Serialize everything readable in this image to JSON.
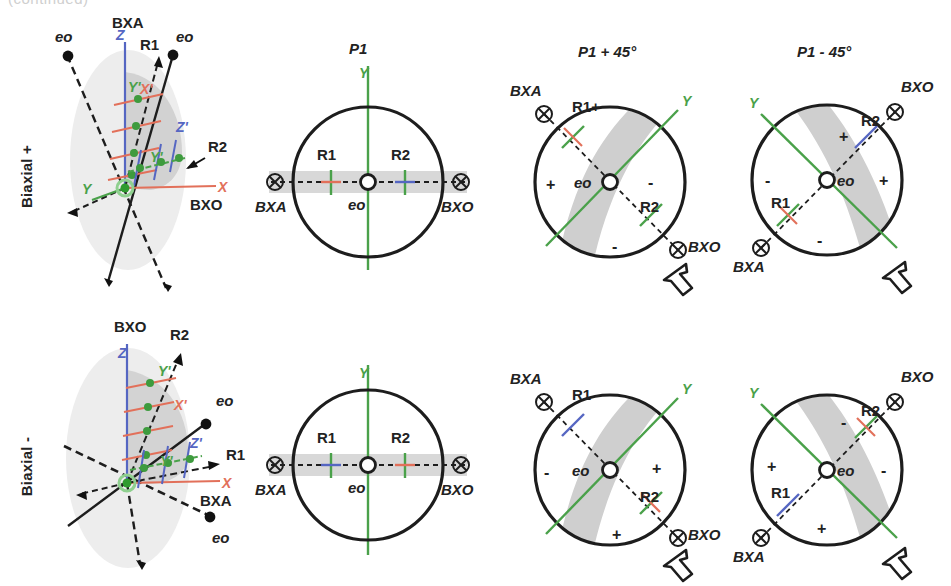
{
  "figure": {
    "clipped_top_text": "(continued)",
    "background": "#ffffff",
    "colors": {
      "axis_x": "#e2705a",
      "axis_y": "#4aa14a",
      "axis_z": "#5566c2",
      "outline": "#1d1d1d",
      "band_shade": "#cfcfcf",
      "blob_shade": "#e6e6e6",
      "blob_core": "#cccccc"
    }
  },
  "rows": [
    {
      "id": "biaxial-positive",
      "label": "Biaxial +"
    },
    {
      "id": "biaxial-negative",
      "label": "Biaxial -"
    }
  ],
  "columns": [
    {
      "id": "three-d",
      "title": ""
    },
    {
      "id": "p1",
      "title": "P1"
    },
    {
      "id": "p1-plus-45",
      "title": "P1 + 45°"
    },
    {
      "id": "p1-minus-45",
      "title": "P1 - 45°"
    }
  ],
  "panels": {
    "biaxial_positive_3d": {
      "axis_labels": {
        "z": "Z",
        "x": "X",
        "y": "Y",
        "z_prime": "Z'",
        "x_prime": "X'",
        "y_prime": "Y'"
      },
      "optic_axes": [
        "eo",
        "eo"
      ],
      "bisectrix_acute": "BXA",
      "bisectrix_obtuse": "BXO",
      "ray_labels": [
        "R1",
        "R2"
      ]
    },
    "biaxial_positive_p1": {
      "title": "P1",
      "y_axis": "Y",
      "center": "eo",
      "left_mark": "BXA",
      "right_mark": "BXO",
      "ray1": "R1",
      "ray2": "R2",
      "ray1_tick_color": "#e2705a",
      "ray2_tick_color": "#5566c2"
    },
    "biaxial_positive_p1_plus45": {
      "title": "P1 + 45°",
      "y_axis": "Y",
      "center": "eo",
      "bxa": "BXA",
      "bxo": "BXO",
      "ray1": "R1+",
      "ray2": "R2",
      "quadrant_signs": [
        "+",
        "-",
        "-"
      ],
      "ray1_tick_color": "#e2705a",
      "ray2_tick_color": "#4aa14a",
      "rotation_arrow": "rotate-ccw-arrow"
    },
    "biaxial_positive_p1_minus45": {
      "title": "P1 - 45°",
      "y_axis": "Y",
      "center": "eo",
      "bxa": "BXA",
      "bxo": "BXO",
      "ray1": "R1",
      "ray2": "R2",
      "quadrant_signs": [
        "+",
        "-",
        "-",
        "+"
      ],
      "ray1_tick_color": "#e2705a",
      "ray2_tick_color": "#5566c2",
      "rotation_arrow": "rotate-ccw-arrow"
    },
    "biaxial_negative_3d": {
      "axis_labels": {
        "z": "Z",
        "x": "X",
        "y": "Y",
        "z_prime": "Z'",
        "x_prime": "X'",
        "y_prime": "Y'"
      },
      "optic_axes": [
        "eo",
        "eo"
      ],
      "bisectrix_acute": "BXA",
      "bisectrix_obtuse": "BXO",
      "ray_labels": [
        "R1",
        "R2"
      ]
    },
    "biaxial_negative_p1": {
      "title": "",
      "y_axis": "Y",
      "center": "eo",
      "left_mark": "BXA",
      "right_mark": "BXO",
      "ray1": "R1",
      "ray2": "R2",
      "ray1_tick_color": "#5566c2",
      "ray2_tick_color": "#e2705a"
    },
    "biaxial_negative_p1_plus45": {
      "title": "",
      "y_axis": "Y",
      "center": "eo",
      "bxa": "BXA",
      "bxo": "BXO",
      "ray1": "R1 -",
      "ray2": "R2",
      "quadrant_signs": [
        "-",
        "+",
        "+"
      ],
      "ray1_tick_color": "#5566c2",
      "ray2_tick_color": "#e2705a",
      "rotation_arrow": "rotate-ccw-arrow"
    },
    "biaxial_negative_p1_minus45": {
      "title": "",
      "y_axis": "Y",
      "center": "eo",
      "bxa": "BXA",
      "bxo": "BXO",
      "ray1": "R1",
      "ray2": "R2",
      "quadrant_signs": [
        "-",
        "-",
        "+",
        "+"
      ],
      "ray1_tick_color": "#5566c2",
      "ray2_tick_color": "#e2705a",
      "rotation_arrow": "rotate-ccw-arrow"
    }
  }
}
